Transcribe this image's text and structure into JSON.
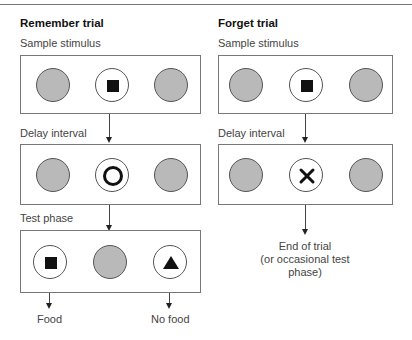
{
  "panels": {
    "remember": {
      "title": "Remember trial",
      "sample_label": "Sample stimulus",
      "sample_stimuli": [
        "gray-disc",
        "square-on-white",
        "gray-disc"
      ],
      "delay_label": "Delay interval",
      "delay_stimuli": [
        "gray-disc",
        "ring-on-white",
        "gray-disc"
      ],
      "test_label": "Test phase",
      "test_stimuli": [
        "square-on-white",
        "gray-disc",
        "triangle-on-white"
      ],
      "outcome_left": "Food",
      "outcome_right": "No food"
    },
    "forget": {
      "title": "Forget trial",
      "sample_label": "Sample stimulus",
      "sample_stimuli": [
        "gray-disc",
        "square-on-white",
        "gray-disc"
      ],
      "delay_label": "Delay interval",
      "delay_stimuli": [
        "gray-disc",
        "x-on-white",
        "gray-disc"
      ],
      "end_line1": "End of trial",
      "end_line2": "(or occasional test",
      "end_line3": "phase)"
    }
  },
  "colors": {
    "disc_gray": "#b9b9b9",
    "border": "#777777",
    "symbol": "#111111"
  }
}
